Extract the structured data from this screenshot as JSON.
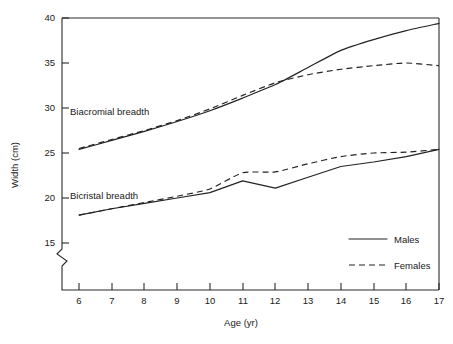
{
  "chart_data": {
    "type": "line",
    "title": "",
    "xlabel": "Age (yr)",
    "ylabel": "Width (cm)",
    "x": [
      6,
      7,
      8,
      9,
      10,
      11,
      12,
      13,
      14,
      15,
      16,
      17
    ],
    "xlim": [
      6,
      17
    ],
    "ylim": [
      15,
      40
    ],
    "xticks": [
      "6",
      "7",
      "8",
      "9",
      "10",
      "11",
      "12",
      "13",
      "14",
      "15",
      "16",
      "17"
    ],
    "yticks": [
      "15",
      "20",
      "25",
      "30",
      "35",
      "40"
    ],
    "grid": false,
    "y_axis_break": true,
    "legend_position": "bottom-right",
    "groups": [
      {
        "name": "Biacromial breadth",
        "annotation": "Biacromial breadth",
        "series": [
          {
            "name": "Males",
            "style": "solid",
            "values": [
              25.4,
              26.4,
              27.4,
              28.5,
              29.7,
              31.1,
              32.6,
              34.5,
              36.4,
              37.6,
              38.6,
              39.4
            ]
          },
          {
            "name": "Females",
            "style": "dashed",
            "values": [
              25.5,
              26.5,
              27.5,
              28.6,
              29.9,
              31.4,
              32.8,
              33.7,
              34.3,
              34.7,
              35.0,
              34.7
            ]
          }
        ]
      },
      {
        "name": "Bicristal breadth",
        "annotation": "Bicristal breadth",
        "series": [
          {
            "name": "Males",
            "style": "solid",
            "values": [
              18.1,
              18.8,
              19.4,
              20.0,
              20.6,
              21.9,
              21.1,
              22.3,
              23.5,
              24.0,
              24.6,
              25.4
            ]
          },
          {
            "name": "Females",
            "style": "dashed",
            "values": [
              18.1,
              18.8,
              19.5,
              20.2,
              21.0,
              22.8,
              22.9,
              23.8,
              24.6,
              25.0,
              25.1,
              25.4
            ]
          }
        ]
      }
    ],
    "legend": [
      {
        "label": "Males",
        "style": "solid"
      },
      {
        "label": "Females",
        "style": "dashed"
      }
    ]
  },
  "axis": {
    "y_label": "Width (cm)",
    "x_label": "Age (yr)",
    "y_tick_15": "15",
    "y_tick_20": "20",
    "y_tick_25": "25",
    "y_tick_30": "30",
    "y_tick_35": "35",
    "y_tick_40": "40",
    "x_tick_6": "6",
    "x_tick_7": "7",
    "x_tick_8": "8",
    "x_tick_9": "9",
    "x_tick_10": "10",
    "x_tick_11": "11",
    "x_tick_12": "12",
    "x_tick_13": "13",
    "x_tick_14": "14",
    "x_tick_15": "15",
    "x_tick_16": "16",
    "x_tick_17": "17"
  },
  "annotations": {
    "biacromial": "Biacromial breadth",
    "bicristal": "Bicristal breadth"
  },
  "legend": {
    "males": "Males",
    "females": "Females"
  },
  "colors": {
    "line": "#222222",
    "axis": "#2b2b2b",
    "text": "#1a1a1a",
    "background": "#ffffff"
  }
}
